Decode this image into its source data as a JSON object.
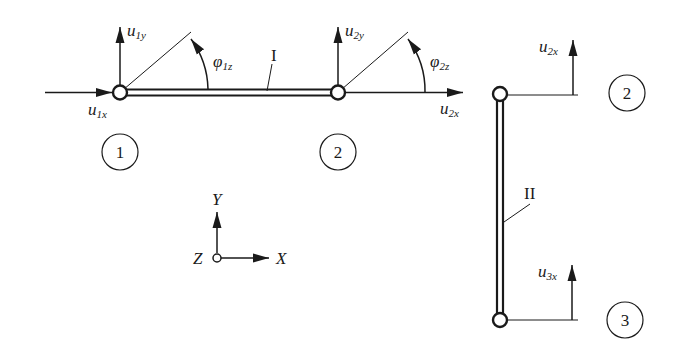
{
  "diagram": {
    "type": "frame-element degrees of freedom",
    "elements": [
      {
        "id": "I",
        "label": "I",
        "orientation": "horizontal",
        "from_node": "1",
        "to_node": "2"
      },
      {
        "id": "II",
        "label": "II",
        "orientation": "vertical",
        "from_node": "2",
        "to_node": "3"
      }
    ],
    "node_labels": {
      "n1": "1",
      "n2_horizontal": "2",
      "n2_vertical": "2",
      "n3": "3"
    },
    "dof_labels": {
      "u1x": {
        "base": "u",
        "sub": "1x"
      },
      "u1y": {
        "base": "u",
        "sub": "1y"
      },
      "phi1z": {
        "base": "φ",
        "sub": "1z"
      },
      "u2x_horizontal": {
        "base": "u",
        "sub": "2x"
      },
      "u2y": {
        "base": "u",
        "sub": "2y"
      },
      "phi2z": {
        "base": "φ",
        "sub": "2z"
      },
      "u2x_vertical": {
        "base": "u",
        "sub": "2x"
      },
      "u3x": {
        "base": "u",
        "sub": "3x"
      }
    },
    "axes": {
      "x": "X",
      "y": "Y",
      "z": "Z"
    }
  }
}
